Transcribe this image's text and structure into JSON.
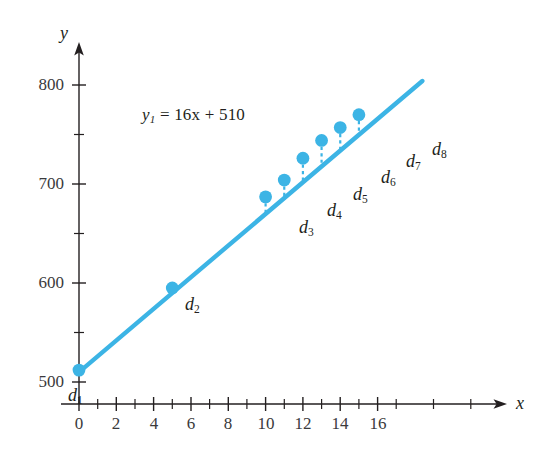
{
  "figure": {
    "background_color": "#ffffff",
    "accent_color": "#3cb4e5",
    "text_color": "#231f20"
  },
  "axes": {
    "x_name": "x",
    "y_name": "y",
    "x_tick_labels": [
      "0",
      "2",
      "4",
      "6",
      "8",
      "10",
      "12",
      "14",
      "16"
    ],
    "y_tick_labels": [
      "500",
      "600",
      "700",
      "800"
    ]
  },
  "annotations": {
    "equation_y": "y",
    "equation_sub": "1",
    "equation_rest": " = 16x + 510"
  },
  "point_labels": [
    {
      "base": "d",
      "sub": "1"
    },
    {
      "base": "d",
      "sub": "2"
    },
    {
      "base": "d",
      "sub": "3"
    },
    {
      "base": "d",
      "sub": "4"
    },
    {
      "base": "d",
      "sub": "5"
    },
    {
      "base": "d",
      "sub": "6"
    },
    {
      "base": "d",
      "sub": "7"
    },
    {
      "base": "d",
      "sub": "8"
    }
  ],
  "chart_data": {
    "type": "scatter",
    "title": "",
    "subtitle": "",
    "xlabel": "x",
    "ylabel": "y",
    "xlim": [
      0,
      18.5
    ],
    "ylim": [
      490,
      810
    ],
    "grid": false,
    "legend": "none",
    "x_ticks_major": [
      0,
      2,
      4,
      6,
      8,
      10,
      12,
      14,
      16
    ],
    "x_ticks_minor": [
      1,
      3,
      5,
      7,
      9,
      11,
      13,
      15,
      17
    ],
    "y_ticks_major": [
      500,
      600,
      700,
      800
    ],
    "y_ticks_minor": [
      550,
      650,
      750
    ],
    "series": [
      {
        "name": "data points",
        "type": "scatter",
        "color": "#3cb4e5",
        "x": [
          0,
          5,
          10,
          11,
          12,
          13,
          14,
          15
        ],
        "y": [
          512,
          595,
          687,
          704,
          726,
          744,
          757,
          770
        ],
        "labels": [
          "d1",
          "d2",
          "d3",
          "d4",
          "d5",
          "d6",
          "d7",
          "d8"
        ]
      },
      {
        "name": "regression line",
        "type": "line",
        "color": "#3cb4e5",
        "equation": "y1 = 16x + 510",
        "slope": 16,
        "intercept": 510,
        "x": [
          0,
          18.4
        ],
        "y": [
          510,
          804
        ]
      }
    ],
    "residuals": {
      "description": "dashed vertical segments from each point down to the fitted line",
      "color": "#3cb4e5",
      "x": [
        10,
        11,
        12,
        13,
        14,
        15
      ],
      "y_point": [
        687,
        704,
        726,
        744,
        757,
        770
      ],
      "y_line": [
        670,
        686,
        702,
        718,
        734,
        750
      ],
      "values": [
        17,
        18,
        24,
        26,
        23,
        20
      ]
    },
    "annotations": [
      {
        "text": "y1 = 16x + 510",
        "x": 3.6,
        "y": 755
      }
    ]
  },
  "geometry": {
    "origin_px": {
      "x": 79,
      "y": 382
    },
    "x_unit_px": 18.66,
    "y_unit_px": 0.99
  }
}
